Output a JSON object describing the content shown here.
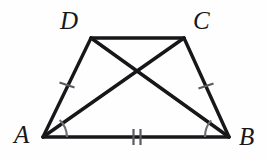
{
  "figure": {
    "kind": "geometry-diagram",
    "shape": "trapezoid-with-diagonals",
    "width": 267,
    "height": 159,
    "background_color": "#fefefe",
    "stroke_color": "#17171a",
    "mark_color": "#5b5b60",
    "labels": {
      "vertex_a": "A",
      "vertex_b": "B",
      "vertex_c": "C",
      "vertex_d": "D"
    },
    "vertices": {
      "A": {
        "x": 43,
        "y": 137
      },
      "B": {
        "x": 229,
        "y": 137
      },
      "C": {
        "x": 184,
        "y": 38
      },
      "D": {
        "x": 91,
        "y": 38
      }
    },
    "label_positions": {
      "A": {
        "x": 14,
        "y": 122
      },
      "B": {
        "x": 239,
        "y": 124
      },
      "C": {
        "x": 193,
        "y": 8
      },
      "D": {
        "x": 60,
        "y": 8
      }
    },
    "segments": [
      {
        "name": "side-AB",
        "from": "A",
        "to": "B",
        "stroke_width": 3.4
      },
      {
        "name": "side-DC",
        "from": "D",
        "to": "C",
        "stroke_width": 3.4
      },
      {
        "name": "side-AD",
        "from": "A",
        "to": "D",
        "stroke_width": 3.4
      },
      {
        "name": "side-BC",
        "from": "B",
        "to": "C",
        "stroke_width": 3.4
      },
      {
        "name": "diagonal-AC",
        "from": "A",
        "to": "C",
        "stroke_width": 3.4
      },
      {
        "name": "diagonal-BD",
        "from": "B",
        "to": "D",
        "stroke_width": 3.4
      }
    ],
    "diagonal_intersection": {
      "x": 139,
      "y": 70
    },
    "tick_marks": [
      {
        "name": "tick-AD",
        "on_segment": "side-AD",
        "count": 1,
        "x": 67,
        "y": 85
      },
      {
        "name": "tick-BC",
        "on_segment": "side-BC",
        "count": 1,
        "x": 206,
        "y": 86
      },
      {
        "name": "tick-AB",
        "on_segment": "side-AB",
        "count": 2,
        "x": 137,
        "y": 137
      }
    ],
    "angle_arcs": [
      {
        "name": "angle-arc-A",
        "at_vertex": "A",
        "radius": 24,
        "between": [
          "side-AB",
          "diagonal-AC"
        ]
      },
      {
        "name": "angle-arc-B",
        "at_vertex": "B",
        "radius": 24,
        "between": [
          "side-AB",
          "diagonal-BD"
        ]
      }
    ]
  }
}
